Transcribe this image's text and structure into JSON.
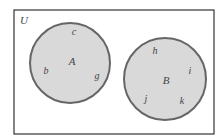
{
  "diagram": {
    "type": "venn",
    "universe": {
      "label": "U",
      "rect": {
        "x": 14,
        "y": 10,
        "width": 200,
        "height": 124
      },
      "stroke": "#333333",
      "fill": "#ffffff"
    },
    "sets": [
      {
        "label": "A",
        "circle": {
          "cx": 70,
          "cy": 63,
          "r": 40
        },
        "label_pos": {
          "x": 72,
          "y": 65
        },
        "elements": [
          {
            "label": "c",
            "x": 74,
            "y": 35
          },
          {
            "label": "b",
            "x": 46,
            "y": 74
          },
          {
            "label": "g",
            "x": 97,
            "y": 79
          }
        ]
      },
      {
        "label": "B",
        "circle": {
          "cx": 165,
          "cy": 79,
          "r": 41
        },
        "label_pos": {
          "x": 166,
          "y": 84
        },
        "elements": [
          {
            "label": "h",
            "x": 155,
            "y": 54
          },
          {
            "label": "i",
            "x": 190,
            "y": 74
          },
          {
            "label": "j",
            "x": 146,
            "y": 102
          },
          {
            "label": "k",
            "x": 182,
            "y": 104
          }
        ]
      }
    ],
    "colors": {
      "circle_fill": "#d9d9d9",
      "circle_stroke": "#666666",
      "text": "#444444"
    }
  }
}
